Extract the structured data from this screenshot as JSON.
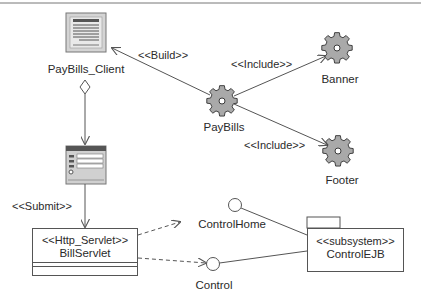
{
  "diagram": {
    "type": "UML component / web application diagram",
    "nodes": {
      "paybills_client": {
        "label": "PayBills_Client",
        "icon": "client-page-icon"
      },
      "form": {
        "icon": "html-form-icon"
      },
      "bill_servlet": {
        "stereotype": "<<Http_Servlet>>",
        "name": "BillServlet"
      },
      "paybills": {
        "label": "PayBills",
        "icon": "server-page-gear-icon"
      },
      "banner": {
        "label": "Banner",
        "icon": "server-page-gear-icon"
      },
      "footer": {
        "label": "Footer",
        "icon": "server-page-gear-icon"
      },
      "control_home": {
        "label": "ControlHome",
        "icon": "interface-lollipop-icon"
      },
      "control": {
        "label": "Control",
        "icon": "interface-lollipop-icon"
      },
      "control_ejb": {
        "stereotype": "<<subsystem>>",
        "name": "ControlEJB",
        "icon": "package-icon"
      }
    },
    "edges": {
      "build": {
        "label": "<<Build>>",
        "from": "PayBills",
        "to": "PayBills_Client"
      },
      "include_banner": {
        "label": "<<Include>>",
        "from": "PayBills",
        "to": "Banner"
      },
      "include_footer": {
        "label": "<<Include>>",
        "from": "PayBills",
        "to": "Footer"
      },
      "submit": {
        "label": "<<Submit>>",
        "from": "Form",
        "to": "BillServlet"
      },
      "aggregation": {
        "from": "PayBills_Client",
        "to": "Form"
      },
      "dep_control_home": {
        "from": "BillServlet",
        "to": "ControlHome",
        "style": "dashed"
      },
      "dep_control": {
        "from": "BillServlet",
        "to": "Control",
        "style": "dashed"
      },
      "realize_control_home": {
        "from": "ControlEJB",
        "to": "ControlHome"
      },
      "realize_control": {
        "from": "ControlEJB",
        "to": "Control"
      }
    },
    "colors": {
      "line": "#555555",
      "icon_fill": "#a8a8a8",
      "icon_dark": "#4a4a4a",
      "background": "#ffffff"
    }
  }
}
